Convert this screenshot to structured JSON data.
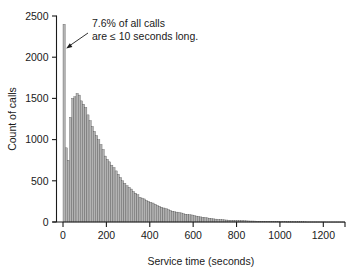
{
  "chart_data": {
    "type": "bar",
    "title": "",
    "subtitle": "",
    "xlabel": "Service time (seconds)",
    "ylabel": "Count of calls",
    "xlim": [
      -30,
      1300
    ],
    "ylim": [
      0,
      2500
    ],
    "grid": false,
    "legend_position": "none",
    "bin_width": 10,
    "x_ticks": [
      0,
      200,
      400,
      600,
      800,
      1000,
      1200
    ],
    "x_tick_labels": [
      "0",
      "200",
      "400",
      "600",
      "800",
      "1000",
      "1200"
    ],
    "y_ticks": [
      0,
      500,
      1000,
      1500,
      2000,
      2500
    ],
    "y_tick_labels": [
      "0",
      "500",
      "1000",
      "1500",
      "2000",
      "2500"
    ],
    "annotations": [
      {
        "name": "spike-callout",
        "line1": "7.6% of all calls",
        "line2": "are ≤ 10 seconds long.",
        "points_to_x": 5,
        "points_to_y": 2100
      }
    ],
    "x": [
      5,
      15,
      25,
      35,
      45,
      55,
      65,
      75,
      85,
      95,
      105,
      115,
      125,
      135,
      145,
      155,
      165,
      175,
      185,
      195,
      205,
      215,
      225,
      235,
      245,
      255,
      265,
      275,
      285,
      295,
      305,
      315,
      325,
      335,
      345,
      355,
      365,
      375,
      385,
      395,
      405,
      415,
      425,
      435,
      445,
      455,
      465,
      475,
      485,
      495,
      505,
      515,
      525,
      535,
      545,
      555,
      565,
      575,
      585,
      595,
      605,
      615,
      625,
      635,
      645,
      655,
      665,
      675,
      685,
      695,
      705,
      715,
      725,
      735,
      745,
      755,
      765,
      775,
      785,
      795,
      805,
      815,
      825,
      835,
      845,
      855,
      865,
      875,
      885,
      895,
      905,
      915,
      925,
      935,
      945,
      955,
      965,
      975,
      985,
      995,
      1005,
      1015,
      1025,
      1035,
      1045,
      1055,
      1065,
      1075,
      1085,
      1095,
      1105,
      1115,
      1125,
      1135,
      1145,
      1155,
      1165,
      1175,
      1185,
      1195,
      1205,
      1215,
      1225,
      1235,
      1245,
      1255,
      1265,
      1275,
      1285,
      1295
    ],
    "values": [
      2400,
      900,
      750,
      1270,
      1500,
      1520,
      1560,
      1540,
      1470,
      1430,
      1390,
      1300,
      1230,
      1160,
      1100,
      1050,
      1000,
      940,
      880,
      800,
      760,
      730,
      690,
      660,
      620,
      580,
      540,
      500,
      470,
      440,
      420,
      400,
      370,
      350,
      330,
      300,
      290,
      280,
      260,
      250,
      240,
      230,
      215,
      200,
      190,
      180,
      170,
      160,
      150,
      140,
      130,
      125,
      120,
      115,
      110,
      100,
      95,
      90,
      88,
      85,
      78,
      72,
      68,
      62,
      58,
      54,
      50,
      46,
      42,
      38,
      35,
      32,
      30,
      28,
      26,
      24,
      22,
      21,
      20,
      19,
      18,
      17,
      16,
      15,
      14,
      13,
      12,
      12,
      11,
      10,
      10,
      9,
      9,
      8,
      8,
      7,
      7,
      6,
      6,
      6,
      5,
      5,
      5,
      4,
      4,
      4,
      4,
      3,
      3,
      3,
      3,
      3,
      2,
      2,
      2,
      2,
      2,
      2,
      2,
      2,
      2,
      1,
      1,
      1,
      1,
      1,
      1,
      1,
      1,
      1
    ],
    "colors": {
      "bar_fill": "#b3b3b3",
      "bar_edge": "#4d4d4d",
      "axis": "#1a1a1a",
      "text": "#1a1a1a",
      "background": "#ffffff"
    }
  }
}
